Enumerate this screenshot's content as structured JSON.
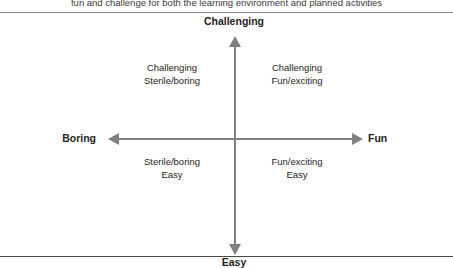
{
  "caption": {
    "text": "fun and challenge for both the learning environment and planned activities"
  },
  "diagram": {
    "type": "two-by-two-matrix",
    "poles": {
      "top": "Challenging",
      "bottom": "Easy",
      "left": "Boring",
      "right": "Fun"
    },
    "axes": {
      "vertical_label_top": "Challenging",
      "vertical_label_bottom": "Easy",
      "horizontal_label_left": "Boring",
      "horizontal_label_right": "Fun",
      "line_color": "#808080"
    },
    "quadrants": [
      {
        "position": "top-left",
        "line1": "Challenging",
        "line2": "Sterile/boring"
      },
      {
        "position": "top-right",
        "line1": "Challenging",
        "line2": "Fun/exciting"
      },
      {
        "position": "bottom-left",
        "line1": "Sterile/boring",
        "line2": "Easy"
      },
      {
        "position": "bottom-right",
        "line1": "Fun/exciting",
        "line2": "Easy"
      }
    ]
  },
  "colors": {
    "text": "#231f20",
    "axis": "#808080",
    "rule_top": "#8e8e8e",
    "rule_bottom": "#4a4a4a",
    "background": "#ffffff"
  }
}
